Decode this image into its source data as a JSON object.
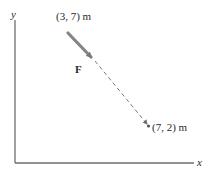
{
  "diagram": {
    "axes": {
      "x_label": "x",
      "y_label": "y"
    },
    "points": [
      {
        "label": "(3, 7) m",
        "x": 3,
        "y": 7
      },
      {
        "label": "(7, 2) m",
        "x": 7,
        "y": 2
      }
    ],
    "force": {
      "label": "F",
      "from": "(3, 7) m",
      "toward": "(7, 2) m"
    },
    "colors": {
      "axis": "#6e6e6e",
      "arrow": "#808080",
      "dashed_line": "#7a7a7a",
      "text": "#2a2a2a"
    }
  }
}
